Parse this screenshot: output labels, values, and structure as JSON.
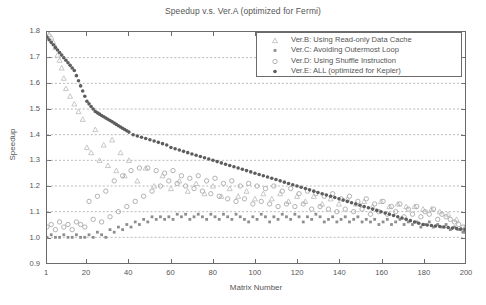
{
  "chart_data": {
    "type": "scatter",
    "title": "Speedup v.s. Ver.A (optimized for Fermi)",
    "xlabel": "Matrix Number",
    "ylabel": "Speedup",
    "xlim": [
      1,
      200
    ],
    "ylim": [
      0.9,
      1.8
    ],
    "grid": "horizontal dashed gridlines at every 0.1 y tick",
    "legend_position": "top-right inside axes",
    "xticks": [
      1,
      20,
      40,
      60,
      80,
      100,
      120,
      140,
      160,
      180,
      200
    ],
    "xtick_labels": [
      "1",
      "20",
      "40",
      "60",
      "80",
      "100",
      "120",
      "140",
      "160",
      "180",
      "200"
    ],
    "yticks": [
      0.9,
      1.0,
      1.1,
      1.2,
      1.3,
      1.4,
      1.5,
      1.6,
      1.7,
      1.8
    ],
    "ytick_labels": [
      "0.9",
      "1.0",
      "1.1",
      "1.2",
      "1.3",
      "1.4",
      "1.5",
      "1.6",
      "1.7",
      "1.8"
    ],
    "series": [
      {
        "name": "Ver.B: Using Read-only Data Cache",
        "marker": "triangle",
        "color": "#b9b9b9",
        "x": [
          1,
          2,
          3,
          4,
          5,
          6,
          7,
          8,
          9,
          10,
          12,
          14,
          16,
          18,
          20,
          22,
          24,
          26,
          28,
          30,
          32,
          34,
          36,
          38,
          40,
          44,
          48,
          52,
          56,
          60,
          64,
          68,
          72,
          76,
          80,
          84,
          88,
          92,
          96,
          100,
          104,
          108,
          112,
          116,
          120,
          124,
          128,
          132,
          136,
          140,
          144,
          148,
          152,
          156,
          160,
          164,
          168,
          172,
          176,
          180,
          184,
          188,
          192,
          196,
          200
        ],
        "y": [
          1.8,
          1.79,
          1.78,
          1.76,
          1.74,
          1.71,
          1.69,
          1.66,
          1.62,
          1.58,
          1.55,
          1.52,
          1.49,
          1.46,
          1.35,
          1.33,
          1.42,
          1.3,
          1.36,
          1.28,
          1.38,
          1.26,
          1.33,
          1.24,
          1.3,
          1.22,
          1.27,
          1.2,
          1.24,
          1.19,
          1.22,
          1.18,
          1.21,
          1.17,
          1.2,
          1.16,
          1.19,
          1.16,
          1.18,
          1.15,
          1.17,
          1.15,
          1.17,
          1.14,
          1.16,
          1.14,
          1.16,
          1.13,
          1.15,
          1.13,
          1.15,
          1.13,
          1.14,
          1.12,
          1.14,
          1.12,
          1.13,
          1.12,
          1.12,
          1.11,
          1.11,
          1.1,
          1.09,
          1.07,
          1.04
        ]
      },
      {
        "name": "Ver.C: Avoiding Outermost Loop",
        "marker": "square",
        "color": "#8d8d8d",
        "x": [
          1,
          3,
          5,
          7,
          9,
          11,
          13,
          15,
          17,
          19,
          21,
          23,
          25,
          27,
          29,
          31,
          33,
          35,
          37,
          39,
          41,
          43,
          45,
          47,
          49,
          51,
          53,
          55,
          57,
          59,
          61,
          63,
          65,
          67,
          69,
          71,
          73,
          75,
          77,
          79,
          81,
          83,
          85,
          87,
          89,
          91,
          93,
          95,
          97,
          99,
          101,
          103,
          105,
          107,
          109,
          111,
          113,
          115,
          117,
          119,
          121,
          123,
          125,
          127,
          129,
          131,
          133,
          135,
          137,
          139,
          141,
          143,
          145,
          147,
          149,
          151,
          153,
          155,
          157,
          159,
          161,
          163,
          165,
          167,
          169,
          171,
          173,
          175,
          177,
          179,
          181,
          183,
          185,
          187,
          189,
          191,
          193,
          195,
          197,
          199,
          200
        ],
        "y": [
          1.0,
          1.01,
          1.0,
          1.0,
          1.01,
          1.0,
          1.0,
          1.01,
          1.0,
          1.0,
          1.01,
          1.0,
          1.02,
          1.01,
          1.0,
          1.03,
          1.02,
          1.04,
          1.03,
          1.05,
          1.04,
          1.06,
          1.05,
          1.07,
          1.06,
          1.08,
          1.07,
          1.08,
          1.07,
          1.08,
          1.07,
          1.09,
          1.08,
          1.09,
          1.07,
          1.08,
          1.09,
          1.08,
          1.07,
          1.09,
          1.08,
          1.07,
          1.09,
          1.08,
          1.07,
          1.09,
          1.08,
          1.07,
          1.06,
          1.08,
          1.07,
          1.09,
          1.08,
          1.06,
          1.08,
          1.07,
          1.09,
          1.08,
          1.07,
          1.09,
          1.08,
          1.06,
          1.08,
          1.07,
          1.09,
          1.08,
          1.06,
          1.07,
          1.08,
          1.06,
          1.07,
          1.08,
          1.06,
          1.07,
          1.08,
          1.06,
          1.07,
          1.06,
          1.07,
          1.05,
          1.06,
          1.07,
          1.05,
          1.06,
          1.07,
          1.05,
          1.06,
          1.05,
          1.06,
          1.04,
          1.05,
          1.06,
          1.04,
          1.05,
          1.04,
          1.05,
          1.03,
          1.04,
          1.03,
          1.02,
          1.02
        ]
      },
      {
        "name": "Ver.D: Using Shuffle Instruction",
        "marker": "circle",
        "color": "#a9a9a9",
        "x": [
          1,
          3,
          5,
          7,
          9,
          11,
          13,
          15,
          17,
          19,
          21,
          23,
          25,
          27,
          29,
          31,
          33,
          35,
          37,
          39,
          41,
          43,
          45,
          47,
          49,
          51,
          53,
          55,
          57,
          59,
          61,
          63,
          65,
          67,
          69,
          71,
          73,
          75,
          77,
          79,
          81,
          83,
          85,
          87,
          89,
          91,
          93,
          95,
          97,
          99,
          101,
          103,
          105,
          107,
          109,
          111,
          113,
          115,
          117,
          119,
          121,
          123,
          125,
          127,
          129,
          131,
          133,
          135,
          137,
          139,
          141,
          143,
          145,
          147,
          149,
          151,
          153,
          155,
          157,
          159,
          161,
          163,
          165,
          167,
          169,
          171,
          173,
          175,
          177,
          179,
          181,
          183,
          185,
          187,
          189,
          191,
          193,
          195,
          197,
          199,
          200
        ],
        "y": [
          1.04,
          1.05,
          1.03,
          1.06,
          1.04,
          1.05,
          1.03,
          1.06,
          1.05,
          1.04,
          1.14,
          1.07,
          1.16,
          1.06,
          1.18,
          1.08,
          1.22,
          1.1,
          1.24,
          1.12,
          1.26,
          1.14,
          1.27,
          1.16,
          1.27,
          1.18,
          1.26,
          1.2,
          1.25,
          1.22,
          1.26,
          1.21,
          1.24,
          1.2,
          1.23,
          1.19,
          1.24,
          1.18,
          1.22,
          1.17,
          1.23,
          1.16,
          1.21,
          1.15,
          1.22,
          1.14,
          1.2,
          1.15,
          1.21,
          1.13,
          1.2,
          1.14,
          1.19,
          1.13,
          1.2,
          1.12,
          1.18,
          1.13,
          1.19,
          1.12,
          1.17,
          1.13,
          1.18,
          1.11,
          1.17,
          1.12,
          1.16,
          1.11,
          1.17,
          1.1,
          1.15,
          1.11,
          1.16,
          1.1,
          1.14,
          1.11,
          1.15,
          1.09,
          1.13,
          1.1,
          1.14,
          1.09,
          1.12,
          1.1,
          1.13,
          1.08,
          1.11,
          1.09,
          1.12,
          1.08,
          1.1,
          1.09,
          1.11,
          1.07,
          1.09,
          1.08,
          1.07,
          1.06,
          1.05,
          1.04,
          1.03
        ]
      },
      {
        "name": "Ver.E: ALL (optimized for Kepler)",
        "marker": "filled-star",
        "color": "#5d5d5d",
        "x": [
          1,
          2,
          3,
          4,
          5,
          6,
          7,
          8,
          9,
          10,
          11,
          12,
          13,
          14,
          15,
          16,
          17,
          18,
          19,
          20,
          21,
          22,
          23,
          24,
          25,
          26,
          27,
          28,
          29,
          30,
          31,
          32,
          33,
          34,
          35,
          36,
          37,
          38,
          39,
          40,
          42,
          44,
          46,
          48,
          50,
          52,
          54,
          56,
          58,
          60,
          62,
          64,
          66,
          68,
          70,
          72,
          74,
          76,
          78,
          80,
          82,
          84,
          86,
          88,
          90,
          92,
          94,
          96,
          98,
          100,
          102,
          104,
          106,
          108,
          110,
          112,
          114,
          116,
          118,
          120,
          122,
          124,
          126,
          128,
          130,
          132,
          134,
          136,
          138,
          140,
          142,
          144,
          146,
          148,
          150,
          152,
          154,
          156,
          158,
          160,
          162,
          164,
          166,
          168,
          170,
          172,
          174,
          176,
          178,
          180,
          182,
          184,
          186,
          188,
          190,
          192,
          194,
          196,
          198,
          200
        ],
        "y": [
          1.78,
          1.77,
          1.76,
          1.75,
          1.74,
          1.73,
          1.72,
          1.71,
          1.7,
          1.69,
          1.68,
          1.67,
          1.66,
          1.65,
          1.63,
          1.61,
          1.59,
          1.57,
          1.55,
          1.53,
          1.52,
          1.51,
          1.5,
          1.49,
          1.485,
          1.48,
          1.475,
          1.47,
          1.465,
          1.46,
          1.455,
          1.45,
          1.445,
          1.44,
          1.435,
          1.43,
          1.425,
          1.42,
          1.415,
          1.41,
          1.4,
          1.395,
          1.39,
          1.385,
          1.38,
          1.375,
          1.37,
          1.365,
          1.36,
          1.35,
          1.345,
          1.34,
          1.335,
          1.33,
          1.325,
          1.32,
          1.315,
          1.31,
          1.305,
          1.3,
          1.295,
          1.29,
          1.285,
          1.28,
          1.275,
          1.27,
          1.265,
          1.26,
          1.255,
          1.25,
          1.245,
          1.24,
          1.235,
          1.23,
          1.225,
          1.22,
          1.215,
          1.21,
          1.205,
          1.2,
          1.195,
          1.19,
          1.185,
          1.18,
          1.175,
          1.17,
          1.165,
          1.16,
          1.155,
          1.15,
          1.145,
          1.14,
          1.135,
          1.13,
          1.125,
          1.12,
          1.115,
          1.11,
          1.105,
          1.1,
          1.095,
          1.09,
          1.085,
          1.08,
          1.075,
          1.07,
          1.065,
          1.06,
          1.055,
          1.05,
          1.048,
          1.046,
          1.044,
          1.042,
          1.04,
          1.038,
          1.036,
          1.034,
          1.032,
          1.03
        ]
      }
    ]
  }
}
